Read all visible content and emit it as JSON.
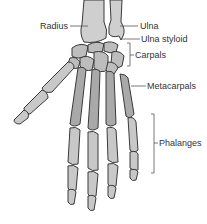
{
  "diagram": {
    "colors": {
      "bone_fill": "#c8c8c8",
      "bone_fill_dark": "#a9a9a9",
      "bone_outline": "#3a3a3a",
      "label_text": "#333333",
      "leader_line": "#555555",
      "background": "#ffffff"
    },
    "labels": {
      "radius": "Radius",
      "ulna": "Ulna",
      "ulna_styloid": "Ulna styloid",
      "carpals": "Carpals",
      "metacarpals": "Metacarpals",
      "phalanges": "Phalanges"
    }
  }
}
